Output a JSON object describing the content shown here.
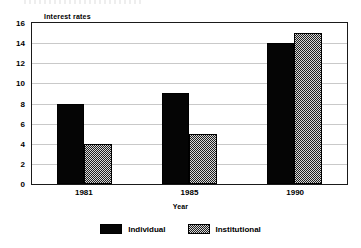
{
  "chart_data": {
    "type": "bar",
    "title": "",
    "subtitle": "",
    "categories": [
      "1981",
      "1985",
      "1990"
    ],
    "series": [
      {
        "name": "Individual",
        "values": [
          8,
          9,
          14
        ],
        "fill": "solid-black",
        "color": "#050505"
      },
      {
        "name": "Institutional",
        "values": [
          4,
          5,
          15
        ],
        "fill": "checker-hatch",
        "color": "#a6a6a6"
      }
    ],
    "xlabel": "Year",
    "ylabel": "Interest rates",
    "ylim": [
      0,
      16
    ],
    "ytick_step": 2,
    "yticks": [
      "16",
      "14",
      "12",
      "10",
      "8",
      "6",
      "4",
      "2",
      "0"
    ],
    "grid": true,
    "grid_axis": "y",
    "legend_position": "bottom-center",
    "legend_orientation": "horizontal",
    "bar_mode": "grouped",
    "axis_color": "#1a1a1a",
    "grid_color": "#c9c9c9",
    "background": "#ffffff"
  },
  "axes": {
    "y_title": "Interest rates",
    "x_title": "Year"
  },
  "legend": {
    "entries": [
      {
        "label": "Individual"
      },
      {
        "label": "Institutional"
      }
    ]
  }
}
